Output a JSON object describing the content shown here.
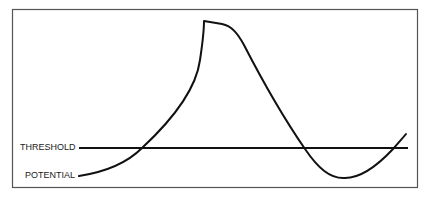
{
  "diagram": {
    "type": "action-potential-sketch",
    "labels": {
      "threshold": "THRESHOLD",
      "potential": "POTENTIAL"
    },
    "colors": {
      "frame": "#555555",
      "line": "#111111",
      "background": "#ffffff"
    }
  }
}
